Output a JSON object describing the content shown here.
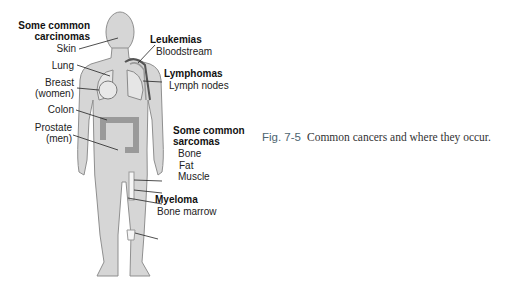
{
  "figure": {
    "number": "Fig. 7-5",
    "caption": "Common cancers and where they occur.",
    "groups": {
      "carcinomas": {
        "title_line1": "Some common",
        "title_line2": "carcinomas",
        "items": [
          "Skin",
          "Lung",
          "Breast",
          "(women)",
          "Colon",
          "Prostate",
          "(men)"
        ]
      },
      "leukemias": {
        "title": "Leukemias",
        "items": [
          "Bloodstream"
        ]
      },
      "lymphomas": {
        "title": "Lymphomas",
        "items": [
          "Lymph nodes"
        ]
      },
      "sarcomas": {
        "title_line1": "Some common",
        "title_line2": "sarcomas",
        "items": [
          "Bone",
          "Fat",
          "Muscle"
        ]
      },
      "myeloma": {
        "title": "Myeloma",
        "items": [
          "Bone marrow"
        ]
      }
    },
    "colors": {
      "body": "#d4d4d4",
      "outline": "#8a8a8a",
      "organ": "#b8b8b8",
      "blood": "#555555",
      "caption_number": "#4d6470"
    }
  }
}
